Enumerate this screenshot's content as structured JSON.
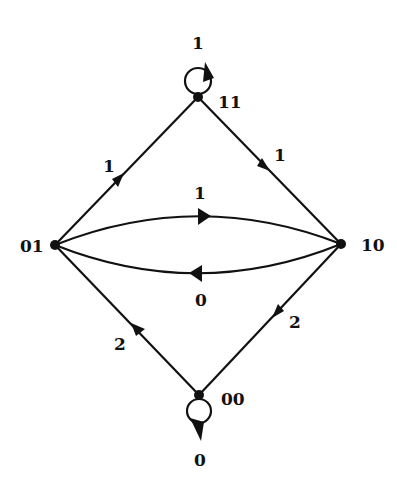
{
  "diagram": {
    "type": "state-transition-diagram",
    "colors": {
      "ink": "#111111",
      "background": "#ffffff"
    },
    "states": [
      {
        "id": "11",
        "label": "11"
      },
      {
        "id": "01",
        "label": "01"
      },
      {
        "id": "10",
        "label": "10"
      },
      {
        "id": "00",
        "label": "00"
      }
    ],
    "transitions": [
      {
        "from": "11",
        "to": "11",
        "label": "1",
        "kind": "self-loop"
      },
      {
        "from": "01",
        "to": "11",
        "label": "1"
      },
      {
        "from": "11",
        "to": "10",
        "label": "1"
      },
      {
        "from": "01",
        "to": "10",
        "label": "1",
        "kind": "upper-arc"
      },
      {
        "from": "10",
        "to": "01",
        "label": "0",
        "kind": "lower-arc"
      },
      {
        "from": "10",
        "to": "00",
        "label": "2"
      },
      {
        "from": "00",
        "to": "01",
        "label": "2"
      },
      {
        "from": "00",
        "to": "00",
        "label": "0",
        "kind": "self-loop"
      }
    ]
  }
}
